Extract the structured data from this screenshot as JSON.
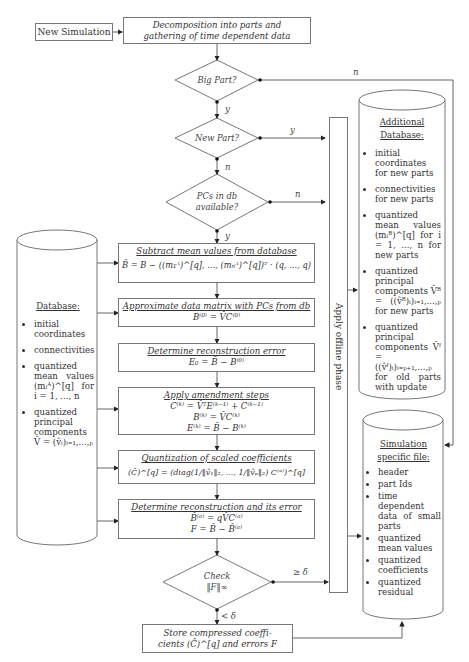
{
  "start": {
    "label": "New Simulation"
  },
  "decomposition": {
    "line1": "Decomposition into parts and",
    "line2": "gathering of time dependent data"
  },
  "decisions": {
    "big_part": {
      "label": "Big Part?",
      "yes": "y",
      "no": "n"
    },
    "new_part": {
      "label": "New Part?",
      "yes": "y",
      "no": "n"
    },
    "pcs_available": {
      "line1": "PCs in db",
      "line2": "available?",
      "yes": "y",
      "no": "n"
    },
    "check": {
      "line1": "Check",
      "line2": "‖F‖∞",
      "ge": "≥ δ",
      "lt": "< δ"
    }
  },
  "steps": [
    {
      "title": "Subtract mean values from database",
      "formulas": [
        "B̃ = B − ((m₁ᴬ)^[q], ..., (mₙᴬ)^[q])ᵀ · (q, ..., q)"
      ]
    },
    {
      "title": "Approximate data matrix with PCs from db",
      "formulas": [
        "B⁽⁰⁾ = V̂C⁽⁰⁾"
      ]
    },
    {
      "title": "Determine reconstruction error",
      "formulas": [
        "E₀ = B̃ − B⁽⁰⁾"
      ]
    },
    {
      "title": "Apply amendment steps",
      "formulas": [
        "C⁽ᵏ⁾ = V̂ᵀE⁽ᵏ⁻¹⁾ + C⁽ᵏ⁻¹⁾",
        "B⁽ᵏ⁾ = V̂C⁽ᵏ⁾",
        "E⁽ᵏ⁾ = B̃ − B⁽ᵏ⁾"
      ]
    },
    {
      "title": "Quantization of scaled coefficients",
      "formulas": [
        "(Ĉ)^[q] = (diag(1/‖v̂₁‖₂, ..., 1/‖v̂ₚ‖₂) C⁽ᵃ⁾)^[q]"
      ]
    },
    {
      "title": "Determine reconstruction and its error",
      "formulas": [
        "B̂⁽ᵃ⁾ = qV̂C⁽ᵃ⁾",
        "F = B̃ − B̂⁽ᵃ⁾"
      ]
    }
  ],
  "store": {
    "line1": "Store compressed coeffi-",
    "line2": "cients (Ĉ)^[q] and errors F"
  },
  "offline_phase": {
    "label": "Apply offline phase"
  },
  "database": {
    "title": "Database:",
    "items": [
      "initial coordinates",
      "connectivities",
      "quantized mean values (mᵢᴬ)^[q] for i = 1, ..., n",
      "quantized principal components V̂ = (v̂ᵢ)ᵢ₌₁,...,ₚ"
    ]
  },
  "additional_database": {
    "title_line1": "Additional",
    "title_line2": "Database:",
    "items": [
      "initial coordinates for new parts",
      "connectivities for new parts",
      "quantized mean values (mᵢᴮ)^[q] for i = 1, ..., n for new parts",
      "quantized principal components V̂ᴮ = ((v̂ᴮ)ᵢ)ᵢ₌₁,...,ₚ for new parts",
      "quantized principal components V̂ᶠ = ((v̂ᶠ)ᵢ)ᵢ₌ₚ₊₁,...,ₚ for old parts with update"
    ]
  },
  "simulation_file": {
    "title_line1": "Simulation",
    "title_line2": "specific file:",
    "items": [
      "header",
      "part Ids",
      "time dependent data of small parts",
      "quantized mean values",
      "quantized coefficients",
      "quantized residual"
    ]
  }
}
